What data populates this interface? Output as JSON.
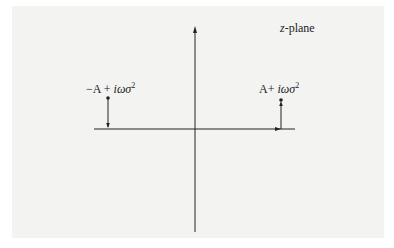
{
  "diagram": {
    "title": "z-plane",
    "plane_label_var": "z",
    "plane_label_suffix": "-plane",
    "points": [
      {
        "label_prefix": "−A + ",
        "label_im": "iωσ",
        "label_exp": "2",
        "position": "left"
      },
      {
        "label_prefix": "A+ ",
        "label_im": "iωσ",
        "label_exp": "2",
        "position": "right"
      }
    ],
    "colors": {
      "axis": "#222222",
      "background": "#f3f3f2"
    }
  }
}
